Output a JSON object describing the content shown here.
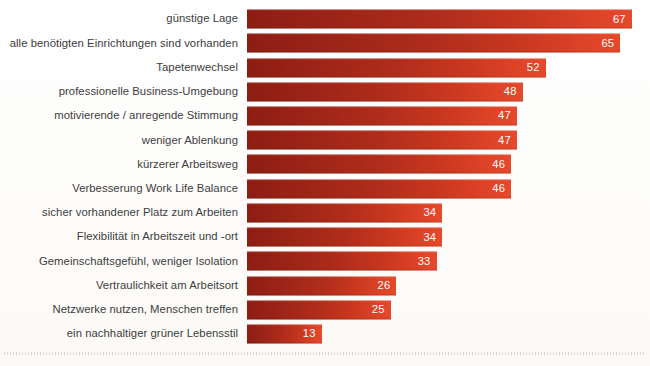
{
  "chart_data": {
    "type": "bar",
    "orientation": "horizontal",
    "title": "",
    "subtitle": "",
    "xlabel": "",
    "ylabel": "",
    "xlim": [
      0,
      70
    ],
    "grid": false,
    "legend": null,
    "value_label_position": "inside-end",
    "categories": [
      "günstige Lage",
      "alle benötigten Einrichtungen sind vorhanden",
      "Tapetenwechsel",
      "professionelle Business-Umgebung",
      "motivierende / anregende Stimmung",
      "weniger Ablenkung",
      "kürzerer Arbeitsweg",
      "Verbesserung Work Life Balance",
      "sicher vorhandener Platz zum Arbeiten",
      "Flexibilität in Arbeitszeit und -ort",
      "Gemeinschaftsgefühl, weniger Isolation",
      "Vertraulichkeit am Arbeitsort",
      "Netzwerke nutzen, Menschen treffen",
      "ein nachhaltiger grüner Lebensstil"
    ],
    "values": [
      67,
      65,
      52,
      48,
      47,
      47,
      46,
      46,
      34,
      34,
      33,
      26,
      25,
      13
    ],
    "bars": [
      {
        "label": "günstige Lage",
        "value": 67
      },
      {
        "label": "alle benötigten Einrichtungen sind vorhanden",
        "value": 65
      },
      {
        "label": "Tapetenwechsel",
        "value": 52
      },
      {
        "label": "professionelle Business-Umgebung",
        "value": 48
      },
      {
        "label": "motivierende / anregende Stimmung",
        "value": 47
      },
      {
        "label": "weniger Ablenkung",
        "value": 47
      },
      {
        "label": "kürzerer Arbeitsweg",
        "value": 46
      },
      {
        "label": "Verbesserung Work Life Balance",
        "value": 46
      },
      {
        "label": "sicher vorhandener Platz zum Arbeiten",
        "value": 34
      },
      {
        "label": "Flexibilität in Arbeitszeit und -ort",
        "value": 34
      },
      {
        "label": "Gemeinschaftsgefühl, weniger Isolation",
        "value": 33
      },
      {
        "label": "Vertraulichkeit am Arbeitsort",
        "value": 26
      },
      {
        "label": "Netzwerke nutzen, Menschen treffen",
        "value": 25
      },
      {
        "label": "ein nachhaltiger grüner Lebensstil",
        "value": 13
      }
    ]
  },
  "colors": {
    "bar_start": "#8d1d13",
    "bar_end": "#e6492c",
    "value_text": "#ffffff",
    "category_text": "#3d3d3d",
    "background": "#fdfdfb",
    "baseline_rule": "#d8d4d0"
  }
}
